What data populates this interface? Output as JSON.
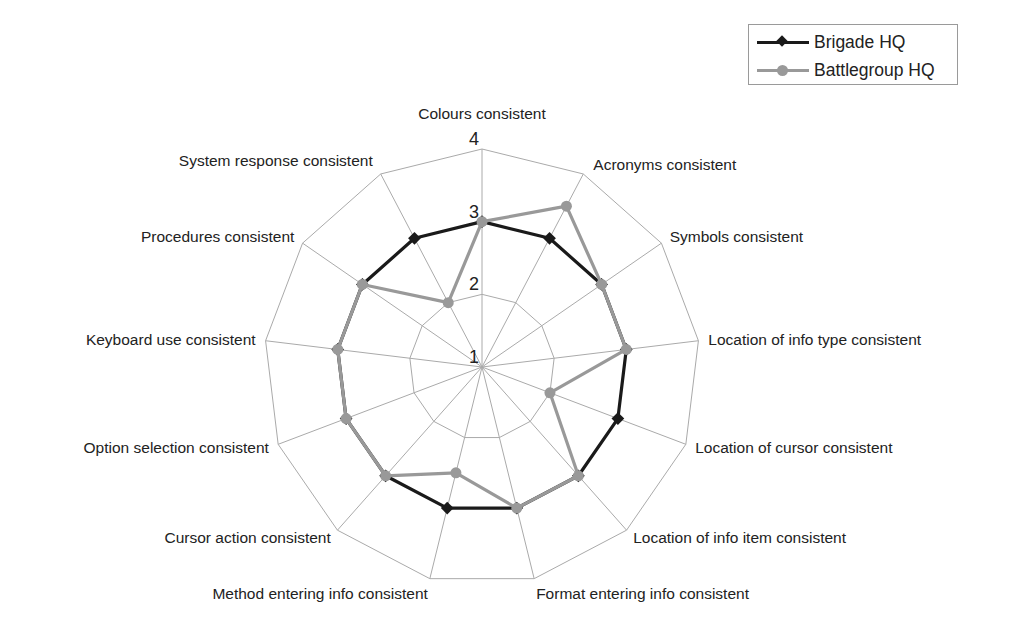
{
  "chart_data": {
    "type": "radar",
    "title": "",
    "axes": [
      "Colours consistent",
      "Acronyms consistent",
      "Symbols consistent",
      "Location of info type consistent",
      "Location of cursor consistent",
      "Location of info item consistent",
      "Format entering info consistent",
      "Method entering info consistent",
      "Cursor action consistent",
      "Option selection consistent",
      "Keyboard use consistent",
      "Procedures consistent",
      "System response consistent"
    ],
    "series": [
      {
        "name": "Brigade HQ",
        "color": "#1a1a1a",
        "marker": "diamond",
        "values": [
          3,
          3,
          3,
          3,
          3,
          3,
          3,
          3,
          3,
          3,
          3,
          3,
          3
        ]
      },
      {
        "name": "Battlegroup HQ",
        "color": "#999999",
        "marker": "circle",
        "values": [
          3,
          3.5,
          3,
          3,
          2,
          3,
          3,
          2.5,
          3,
          3,
          3,
          3,
          2
        ]
      }
    ],
    "rlim": [
      1,
      4
    ],
    "ticks": [
      "1",
      "2",
      "3",
      "4"
    ],
    "grid": true,
    "legend_position": "top-right"
  },
  "legend": {
    "items": [
      {
        "label": "Brigade HQ"
      },
      {
        "label": "Battlegroup HQ"
      }
    ]
  }
}
